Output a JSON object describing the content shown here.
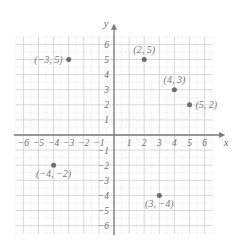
{
  "chart_data": {
    "type": "scatter",
    "title": "",
    "xlabel": "x",
    "ylabel": "y",
    "xlim": [
      -6.5,
      6.5
    ],
    "ylim": [
      -6.5,
      6.5
    ],
    "xticks": [
      -6,
      -5,
      -4,
      -3,
      -2,
      -1,
      1,
      2,
      3,
      4,
      5,
      6
    ],
    "yticks": [
      6,
      5,
      4,
      3,
      2,
      1,
      -1,
      -2,
      -3,
      -4,
      -5,
      -6
    ],
    "xtick_labels": [
      "−6",
      "−5",
      "−4",
      "−3",
      "−2",
      "−1",
      "1",
      "2",
      "3",
      "4",
      "5",
      "6"
    ],
    "ytick_labels": [
      "6",
      "5",
      "4",
      "3",
      "2",
      "1",
      "−1",
      "−2",
      "−3",
      "−4",
      "−5",
      "−6"
    ],
    "grid": true,
    "grid_minor": true,
    "grid_step": 1,
    "grid_minor_step": 0.5,
    "legend": "none",
    "points": [
      {
        "x": -3,
        "y": 5,
        "label": "(−3, 5)",
        "label_pos": "left"
      },
      {
        "x": 2,
        "y": 5,
        "label": "(2, 5)",
        "label_pos": "above"
      },
      {
        "x": 4,
        "y": 3,
        "label": "(4, 3)",
        "label_pos": "above"
      },
      {
        "x": 5,
        "y": 2,
        "label": "(5, 2)",
        "label_pos": "right"
      },
      {
        "x": -4,
        "y": -2,
        "label": "(−4, −2)",
        "label_pos": "below"
      },
      {
        "x": 3,
        "y": -4,
        "label": "(3, −4)",
        "label_pos": "below"
      }
    ]
  },
  "colors": {
    "background": "#ffffff",
    "axis": "#7a7a7f",
    "grid_major": "#c9c9cf",
    "grid_minor": "#d8d8de",
    "point": "#6b6b70",
    "text": "#6e6e72",
    "label_text": "#77777c"
  },
  "axes": {
    "x_axis_label": "x",
    "y_axis_label": "y"
  }
}
